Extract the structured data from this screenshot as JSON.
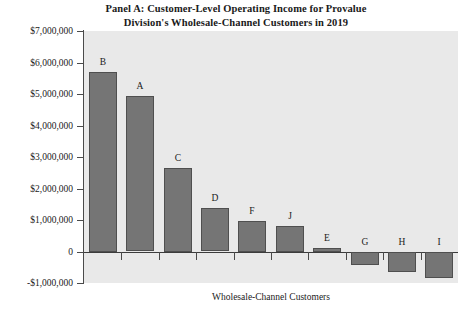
{
  "chart_data": {
    "type": "bar",
    "title": "Panel A: Customer-Level Operating Income for Provalue Division's Wholesale-Channel Customers in 2019",
    "title_lines": [
      "Panel A: Customer-Level Operating Income for Provalue",
      "Division's Wholesale-Channel Customers in 2019"
    ],
    "xlabel": "Wholesale-Channel Customers",
    "ylabel": "",
    "categories": [
      "B",
      "A",
      "C",
      "D",
      "F",
      "J",
      "E",
      "G",
      "H",
      "I"
    ],
    "values": [
      5700000,
      4930000,
      2660000,
      1380000,
      970000,
      810000,
      120000,
      -410000,
      -630000,
      -810000
    ],
    "ylim": [
      -1000000,
      7000000
    ],
    "ytick_values": [
      7000000,
      6000000,
      5000000,
      4000000,
      3000000,
      2000000,
      1000000,
      0,
      -1000000
    ],
    "ytick_labels": [
      "$7,000,000",
      "$6,000,000",
      "$5,000,000",
      "$4,000,000",
      "$3,000,000",
      "$2,000,000",
      "$1,000,000",
      "0",
      "-$1,000,000"
    ],
    "grid": false,
    "legend": null,
    "bar_color": "#757575",
    "bar_edge_color": "#4f4f4f",
    "plot_background": "#e9e9e9",
    "figure_background": "#ffffff",
    "axis_color": "#4a4a4a"
  }
}
